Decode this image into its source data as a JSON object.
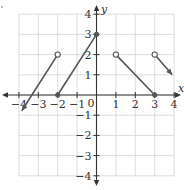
{
  "chart_data": {
    "type": "line",
    "title": "",
    "xlabel": "x",
    "ylabel": "y",
    "xlim": [
      -4,
      4
    ],
    "ylim": [
      -4,
      4
    ],
    "grid": true,
    "x_ticks": [
      -4,
      -3,
      -2,
      -1,
      0,
      1,
      2,
      3,
      4
    ],
    "y_ticks": [
      -4,
      -3,
      -2,
      -1,
      1,
      2,
      3,
      4
    ],
    "x_tick_labels": [
      "−4",
      "−3",
      "−2",
      "−1",
      "0",
      "1",
      "2",
      "3",
      "4"
    ],
    "y_tick_labels": [
      "−4",
      "−3",
      "−2",
      "−1",
      "1",
      "2",
      "3",
      "4"
    ],
    "origin_label": "0",
    "series": [
      {
        "name": "piece-1",
        "points": [
          [
            -3.85,
            -0.78
          ],
          [
            -2,
            2
          ]
        ],
        "start": "arrow",
        "end": "open"
      },
      {
        "name": "piece-2",
        "points": [
          [
            -2,
            0
          ],
          [
            0,
            3
          ]
        ],
        "start": "closed",
        "end": "closed"
      },
      {
        "name": "piece-3",
        "points": [
          [
            1,
            2
          ],
          [
            3,
            0
          ]
        ],
        "start": "open",
        "end": "closed"
      },
      {
        "name": "piece-4",
        "points": [
          [
            3,
            2
          ],
          [
            3.9,
            1.0
          ]
        ],
        "start": "open",
        "end": "arrow"
      }
    ],
    "colors": {
      "curve": "#555555",
      "axis": "#333333",
      "grid": "#d4d4d4"
    }
  }
}
